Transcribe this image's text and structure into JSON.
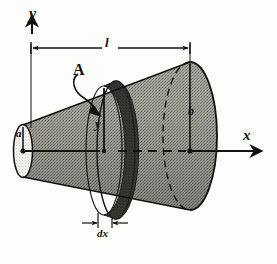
{
  "figure": {
    "background_color": "#fdfdfb",
    "ink_color": "#121212",
    "body_fill_color": "#9a9a93",
    "end_face_fill_color": "#f2f1ec",
    "slab_fill_color": "#3d3d3a"
  },
  "axes": {
    "y_label": "y",
    "x_label": "x"
  },
  "dimensions": {
    "length_label": "l",
    "small_radius_label": "a",
    "large_radius_label": "b",
    "slab_radius_label": "y",
    "slab_thickness_label": "dx",
    "area_label": "A"
  }
}
